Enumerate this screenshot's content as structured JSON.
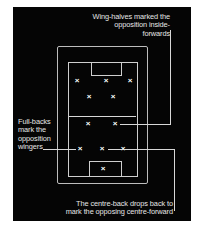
{
  "annotations": {
    "wing_halves": [
      "Wing-halves marked the",
      "opposition inside-forwards"
    ],
    "full_backs": [
      "Full-backs",
      "mark the",
      "opposition",
      "wingers"
    ],
    "centre_back": [
      "The centre-back drops back to",
      "mark the opposing centre-forward"
    ]
  },
  "players": [
    {
      "role": "forward-left",
      "symbol": "×"
    },
    {
      "role": "forward-centre",
      "symbol": "×"
    },
    {
      "role": "forward-right",
      "symbol": "×"
    },
    {
      "role": "inside-left",
      "symbol": "×"
    },
    {
      "role": "inside-right",
      "symbol": "×"
    },
    {
      "role": "wing-half-left",
      "symbol": "×"
    },
    {
      "role": "wing-half-right",
      "symbol": "×"
    },
    {
      "role": "full-back-left",
      "symbol": "×"
    },
    {
      "role": "centre-back",
      "symbol": "×"
    },
    {
      "role": "full-back-right",
      "symbol": "×"
    },
    {
      "role": "goalkeeper",
      "symbol": "×"
    }
  ],
  "colors": {
    "background": "#050505",
    "lines": "#d8d8d8",
    "text": "#e6e6e6"
  }
}
